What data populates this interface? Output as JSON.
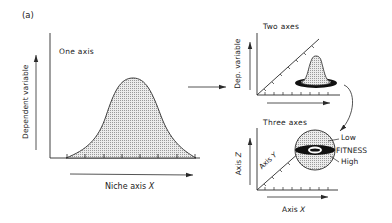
{
  "figure": {
    "panel_label": "(a)",
    "panels": [
      {
        "id": "one-axis",
        "title": "One axis",
        "y_label": "Dependent variable",
        "x_label_prefix": "Niche axis ",
        "x_label_var": "X",
        "shape": "bell-curve",
        "tick_count": 8
      },
      {
        "id": "two-axes",
        "title": "Two axes",
        "y_label": "Dep. variable",
        "shape": "bell-surface-with-base-ring"
      },
      {
        "id": "three-axes",
        "title": "Three axes",
        "z_label_prefix": "Axis ",
        "z_label_var": "Z",
        "y_label_prefix": "Axis ",
        "y_label_var": "Y",
        "x_label_prefix": "Axis ",
        "x_label_var": "X",
        "shape": "fitness-sphere",
        "fitness_labels": {
          "low": "Low",
          "title": "FITNESS",
          "high": "High"
        }
      }
    ],
    "colors": {
      "line": "#2a2a2a",
      "fill_stipple": "#d6d6d6",
      "ring": "#111111",
      "background": "#ffffff"
    }
  }
}
